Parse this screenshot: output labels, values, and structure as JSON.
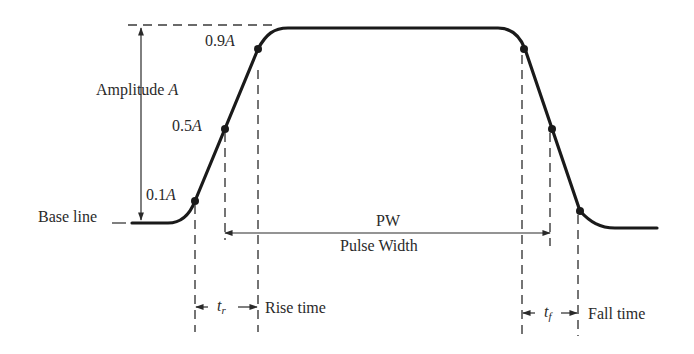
{
  "figure": {
    "labels": {
      "amplitude": "Amplitude ",
      "amplitude_symbol": "A",
      "level_09": "0.9",
      "level_05": "0.5",
      "level_01": "0.1",
      "level_symbol": "A",
      "baseline": "Base line",
      "pw": "PW",
      "pulse_width": "Pulse Width",
      "tr_symbol": "t",
      "tr_sub": "r",
      "rise_time": "Rise time",
      "tf_symbol": "t",
      "tf_sub": "f",
      "fall_time": "Fall time"
    },
    "levels": [
      0.1,
      0.5,
      0.9
    ],
    "colors": {
      "ink": "#1a1a1a",
      "background": "#ffffff"
    }
  }
}
